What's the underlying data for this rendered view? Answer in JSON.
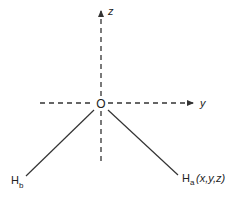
{
  "diagram": {
    "type": "coordinate-axes",
    "colors": {
      "line": "#333333",
      "text": "#222222",
      "background": "#ffffff"
    },
    "origin": {
      "label": "O"
    },
    "axes": [
      {
        "name": "z",
        "label": "z",
        "direction": "up",
        "style": "dashed",
        "arrow": true
      },
      {
        "name": "y",
        "label": "y",
        "direction": "right",
        "style": "dashed",
        "arrow": true
      }
    ],
    "atoms": [
      {
        "id": "Hb",
        "symbol": "H",
        "subscript": "b",
        "coords": ""
      },
      {
        "id": "Ha",
        "symbol": "H",
        "subscript": "a",
        "coords": "(x,y,z)"
      }
    ]
  }
}
